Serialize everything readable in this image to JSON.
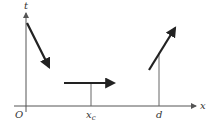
{
  "diagram": {
    "axes": {
      "x_label": "x",
      "y_label": "t",
      "origin_label": "O"
    },
    "tick_labels": {
      "xc_main": "x",
      "xc_sub": "c",
      "d": "d"
    },
    "colors": {
      "axis": "#555555",
      "arrow": "#222222",
      "text": "#333333"
    }
  }
}
